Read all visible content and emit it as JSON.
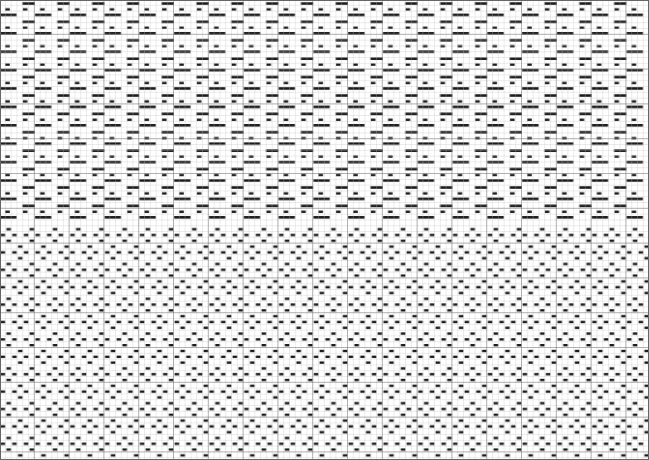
{
  "grid": {
    "width": 649,
    "height": 460,
    "cell": 5.8,
    "major_every": 6,
    "line_color": "#b8b8b8",
    "major_line_color": "#555555",
    "fill_color": "#1a1a1a",
    "background": "#ffffff"
  },
  "sections": [
    {
      "name": "upper-pattern",
      "y_start": 0,
      "y_end": 226,
      "description": "long and short float bars, brick-staggered"
    },
    {
      "name": "lower-pattern",
      "y_start": 226,
      "y_end": 460,
      "description": "short single-float bars, diagonal stagger"
    }
  ]
}
